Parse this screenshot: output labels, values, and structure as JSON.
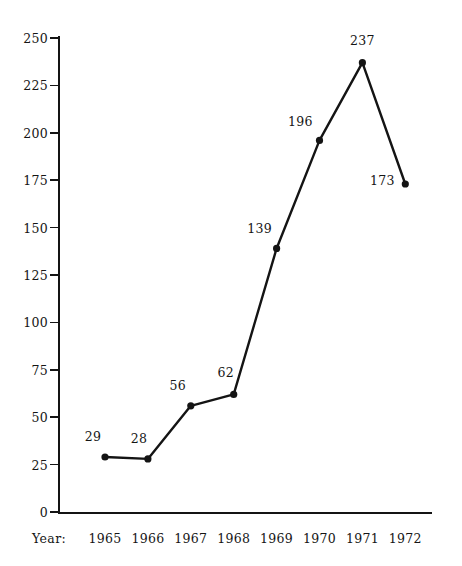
{
  "title": {
    "text": "",
    "visible_note": "cut-off header line at top edge"
  },
  "axis": {
    "x_caption": "Year:",
    "y_ticks": [
      "0",
      "25",
      "50",
      "75",
      "100",
      "125",
      "150",
      "175",
      "200",
      "225",
      "250"
    ]
  },
  "chart_data": {
    "type": "line",
    "title": "",
    "xlabel": "Year:",
    "ylabel": "",
    "categories": [
      "1965",
      "1966",
      "1967",
      "1968",
      "1969",
      "1970",
      "1971",
      "1972"
    ],
    "values": [
      29,
      28,
      56,
      62,
      139,
      196,
      237,
      173
    ],
    "point_labels": [
      "29",
      "28",
      "56",
      "62",
      "139",
      "196",
      "237",
      "173"
    ],
    "ylim": [
      0,
      250
    ],
    "ytick_values": [
      0,
      25,
      50,
      75,
      100,
      125,
      150,
      175,
      200,
      225,
      250
    ],
    "ytick_labels": [
      "0",
      "25",
      "50",
      "75",
      "100",
      "125",
      "150",
      "175",
      "200",
      "225",
      "250"
    ],
    "grid": false,
    "legend": false,
    "marker": "filled-circle",
    "line_color": "#141414",
    "marker_color": "#141414",
    "background_color": "#ffffff"
  }
}
